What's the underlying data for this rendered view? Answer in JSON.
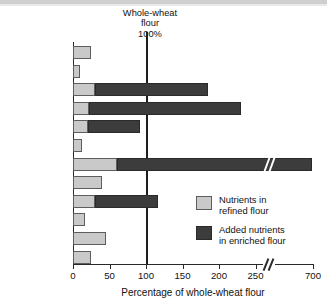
{
  "chart_data": {
    "type": "bar",
    "title": "Whole-wheat flour 100%",
    "title_lines": [
      "Whole-wheat",
      "flour",
      "100%"
    ],
    "xlabel": "Percentage of whole-wheat flour",
    "ylabel": "",
    "orientation": "horizontal",
    "stacked": true,
    "grid": false,
    "reference_line": {
      "value": 100,
      "label": "Whole-wheat flour 100%"
    },
    "axis_break": {
      "after": 250,
      "before": 700,
      "symbol": "//"
    },
    "xlim": [
      0,
      700
    ],
    "xticks": [
      0,
      50,
      100,
      150,
      200,
      250,
      700
    ],
    "xtick_labels": [
      "0",
      "50",
      "100",
      "150",
      "200",
      "250",
      "700"
    ],
    "categories": [
      "Fiber",
      "Vitamin E",
      "Thiamin",
      "Riboflavin",
      "Niacin",
      "Vitamin B6",
      "Folate",
      "Copper",
      "Iron",
      "Magnesium",
      "Selenium",
      "Zinc"
    ],
    "category_labels_html": [
      "Fiber",
      "Vitamin E",
      "Thiamin",
      "Riboflavin",
      "Niacin",
      "Vitamin B<sub>6</sub>",
      "Folate",
      "Copper",
      "Iron",
      "Magnesium",
      "Selenium",
      "Zinc"
    ],
    "legend_position": "right-lower",
    "series": [
      {
        "name": "Nutrients in refined flour",
        "name_lines": [
          "Nutrients in",
          "refined flour"
        ],
        "color": "#c9c9c9",
        "values": [
          25,
          9,
          30,
          22,
          20,
          13,
          60,
          40,
          30,
          17,
          45,
          25
        ]
      },
      {
        "name": "Added nutrients in enriched flour",
        "name_lines": [
          "Added nutrients",
          "in enriched flour"
        ],
        "color": "#3c3c3c",
        "values": [
          0,
          0,
          155,
          208,
          72,
          0,
          630,
          0,
          86,
          0,
          0,
          0
        ]
      }
    ],
    "totals": [
      25,
      9,
      185,
      230,
      92,
      13,
      690,
      40,
      116,
      17,
      45,
      25
    ]
  },
  "colors": {
    "refined": "#c9c9c9",
    "added": "#3c3c3c",
    "axis": "#2a2a2a",
    "reference_line": "#1d1d1d",
    "background": "#ffffff",
    "text": "#111111"
  }
}
